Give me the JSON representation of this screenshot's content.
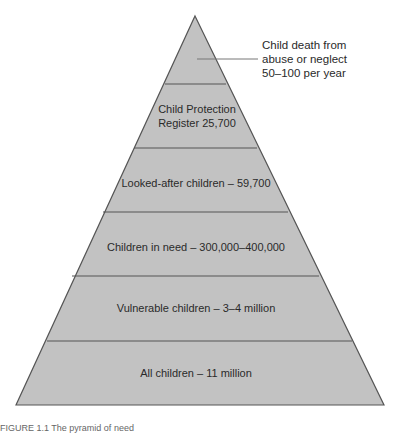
{
  "diagram": {
    "type": "pyramid",
    "fill_color": "#c2c2c2",
    "stroke_color": "#555555",
    "layers": [
      {
        "label": "",
        "callout": "Child death from\nabuse or neglect\n50–100 per year"
      },
      {
        "label_line1": "Child Protection",
        "label_line2": "Register 25,700"
      },
      {
        "label": "Looked-after children – 59,700"
      },
      {
        "label": "Children in need – 300,000–400,000"
      },
      {
        "label": "Vulnerable children – 3–4 million"
      },
      {
        "label": "All children – 11 million"
      }
    ],
    "caption": "FIGURE 1.1  The pyramid of need"
  }
}
